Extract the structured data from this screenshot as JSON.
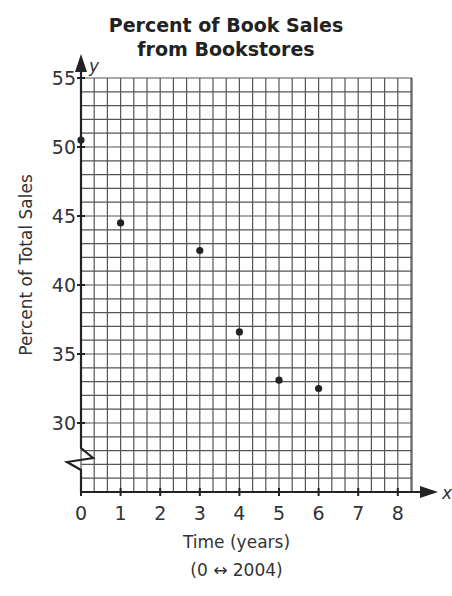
{
  "chart_data": {
    "type": "scatter",
    "title_lines": [
      "Percent of Book Sales",
      "from Bookstores"
    ],
    "xlabel": "Time (years)",
    "xlabel_sub": "(0 ↔ 2004)",
    "ylabel": "Percent of Total Sales",
    "x_axis_letter": "x",
    "y_axis_letter": "y",
    "xlim": [
      0,
      8.4
    ],
    "ylim": [
      25,
      55
    ],
    "y_axis_break": true,
    "grid": true,
    "x_ticks": [
      "0",
      "1",
      "2",
      "3",
      "4",
      "5",
      "6",
      "7",
      "8"
    ],
    "y_ticks": [
      "30",
      "35",
      "40",
      "45",
      "50",
      "55"
    ],
    "points": [
      {
        "x": 0,
        "y": 50.5
      },
      {
        "x": 1,
        "y": 44.5
      },
      {
        "x": 3,
        "y": 42.5
      },
      {
        "x": 4,
        "y": 36.6
      },
      {
        "x": 5,
        "y": 33.1
      },
      {
        "x": 6,
        "y": 32.5
      }
    ]
  }
}
